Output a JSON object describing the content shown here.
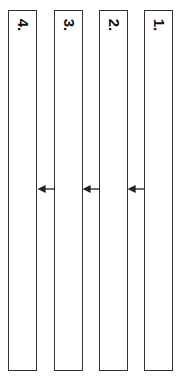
{
  "diagram": {
    "boxes": [
      {
        "label": "1.",
        "x": 144
      },
      {
        "label": "2.",
        "x": 99
      },
      {
        "label": "3.",
        "x": 54
      },
      {
        "label": "4.",
        "x": 8
      }
    ],
    "arrows": [
      {
        "from": "1.",
        "to": "2.",
        "y": 189
      },
      {
        "from": "2.",
        "to": "3.",
        "y": 189
      },
      {
        "from": "3.",
        "to": "4.",
        "y": 189
      }
    ],
    "colors": {
      "stroke": "#333333",
      "background": "#ffffff"
    }
  }
}
